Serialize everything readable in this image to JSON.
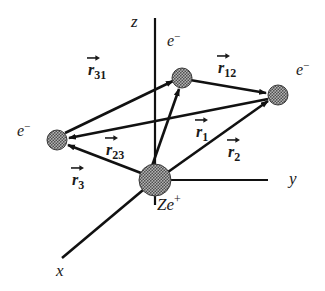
{
  "figure": {
    "background_color": "#ffffff",
    "line_color": "#111111",
    "sphere_fill": "#8c8c8c",
    "sphere_stroke": "#2b2b2b",
    "text_color": "#1a1a1a"
  },
  "axes": [
    {
      "name": "z",
      "label": "z",
      "direction": "up"
    },
    {
      "name": "y",
      "label": "y",
      "direction": "right"
    },
    {
      "name": "x",
      "label": "x",
      "direction": "down-left"
    }
  ],
  "nucleus": {
    "label": "Ze",
    "charge": "+",
    "full_label": "Ze+",
    "x": 155,
    "y": 180,
    "radius": 16
  },
  "electrons": [
    {
      "id": "e1",
      "label": "e",
      "charge": "−",
      "x": 182,
      "y": 78,
      "radius": 10
    },
    {
      "id": "e2",
      "label": "e",
      "charge": "−",
      "x": 278,
      "y": 95,
      "radius": 10
    },
    {
      "id": "e3",
      "label": "e",
      "charge": "−",
      "x": 57,
      "y": 140,
      "radius": 10
    }
  ],
  "vectors": [
    {
      "id": "r1",
      "symbol": "r",
      "subscript": "1",
      "from": "nucleus",
      "to": "e1",
      "label_x": 196,
      "label_y": 122
    },
    {
      "id": "r2",
      "symbol": "r",
      "subscript": "2",
      "from": "nucleus",
      "to": "e2",
      "label_x": 228,
      "label_y": 142
    },
    {
      "id": "r3",
      "symbol": "r",
      "subscript": "3",
      "from": "nucleus",
      "to": "e3",
      "label_x": 72,
      "label_y": 170
    },
    {
      "id": "r12",
      "symbol": "r",
      "subscript": "12",
      "from": "e1",
      "to": "e2",
      "label_x": 218,
      "label_y": 58
    },
    {
      "id": "r23",
      "symbol": "r",
      "subscript": "23",
      "from": "e2",
      "to": "e3",
      "label_x": 106,
      "label_y": 140
    },
    {
      "id": "r31",
      "symbol": "r",
      "subscript": "31",
      "from": "e3",
      "to": "e1",
      "label_x": 88,
      "label_y": 60
    }
  ]
}
